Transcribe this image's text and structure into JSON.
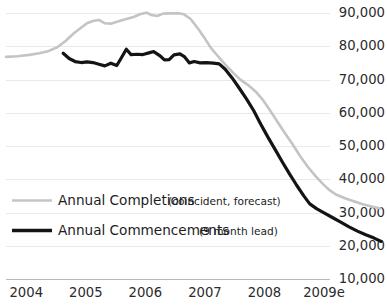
{
  "chart_data": {
    "type": "line",
    "title": "",
    "subtitle": "",
    "xlabel": "",
    "ylabel": "",
    "grid": true,
    "legend_position": "inside-lower-left",
    "x": [
      2004,
      2005,
      2006,
      2007,
      2008,
      2009
    ],
    "xtick_labels": [
      "2004",
      "2005",
      "2006",
      "2007",
      "2008",
      "2009e"
    ],
    "ytick_labels": [
      "90,000",
      "80,000",
      "70,000",
      "60,000",
      "50,000",
      "40,000",
      "30,000",
      "20,000",
      "10,000"
    ],
    "ytick_values": [
      90000,
      80000,
      70000,
      60000,
      50000,
      40000,
      30000,
      20000,
      10000
    ],
    "ylim": [
      10000,
      93000
    ],
    "xlim": [
      2003.66,
      2009.1
    ],
    "series": [
      {
        "name": "Annual Completions",
        "annotation": "(coincident, forecast)",
        "color": "#c4c4c4",
        "points": [
          [
            2003.66,
            76800
          ],
          [
            2003.85,
            77000
          ],
          [
            2004.05,
            77400
          ],
          [
            2004.22,
            77900
          ],
          [
            2004.38,
            78600
          ],
          [
            2004.52,
            79700
          ],
          [
            2004.66,
            81600
          ],
          [
            2004.8,
            83900
          ],
          [
            2004.93,
            85700
          ],
          [
            2005.02,
            86900
          ],
          [
            2005.12,
            87600
          ],
          [
            2005.22,
            87900
          ],
          [
            2005.32,
            86900
          ],
          [
            2005.42,
            86800
          ],
          [
            2005.55,
            87500
          ],
          [
            2005.68,
            88200
          ],
          [
            2005.8,
            88800
          ],
          [
            2005.92,
            89700
          ],
          [
            2006.02,
            90100
          ],
          [
            2006.1,
            89400
          ],
          [
            2006.2,
            89100
          ],
          [
            2006.3,
            89800
          ],
          [
            2006.42,
            89900
          ],
          [
            2006.55,
            89900
          ],
          [
            2006.65,
            89600
          ],
          [
            2006.76,
            88200
          ],
          [
            2006.88,
            85400
          ],
          [
            2007.0,
            82300
          ],
          [
            2007.1,
            79500
          ],
          [
            2007.22,
            77000
          ],
          [
            2007.35,
            74300
          ],
          [
            2007.48,
            71900
          ],
          [
            2007.6,
            69900
          ],
          [
            2007.72,
            68400
          ],
          [
            2007.85,
            66400
          ],
          [
            2007.98,
            63700
          ],
          [
            2008.1,
            60500
          ],
          [
            2008.22,
            57200
          ],
          [
            2008.35,
            53700
          ],
          [
            2008.48,
            50300
          ],
          [
            2008.6,
            46900
          ],
          [
            2008.72,
            43900
          ],
          [
            2008.85,
            41100
          ],
          [
            2008.98,
            38600
          ],
          [
            2009.08,
            36900
          ],
          [
            2009.2,
            35400
          ],
          [
            2009.35,
            34300
          ],
          [
            2009.5,
            33400
          ],
          [
            2009.65,
            32500
          ],
          [
            2009.8,
            31800
          ],
          [
            2009.95,
            31200
          ]
        ]
      },
      {
        "name": "Annual Commencements",
        "annotation": "(9 month lead)",
        "color": "#141414",
        "points": [
          [
            2004.62,
            77900
          ],
          [
            2004.72,
            76300
          ],
          [
            2004.82,
            75400
          ],
          [
            2004.92,
            75100
          ],
          [
            2005.02,
            75300
          ],
          [
            2005.12,
            75100
          ],
          [
            2005.22,
            74600
          ],
          [
            2005.32,
            74100
          ],
          [
            2005.42,
            74900
          ],
          [
            2005.52,
            74200
          ],
          [
            2005.6,
            76600
          ],
          [
            2005.68,
            79100
          ],
          [
            2005.76,
            77500
          ],
          [
            2005.86,
            77600
          ],
          [
            2005.96,
            77500
          ],
          [
            2006.06,
            78000
          ],
          [
            2006.14,
            78400
          ],
          [
            2006.24,
            77200
          ],
          [
            2006.32,
            75900
          ],
          [
            2006.4,
            76000
          ],
          [
            2006.48,
            77400
          ],
          [
            2006.58,
            77700
          ],
          [
            2006.66,
            76800
          ],
          [
            2006.74,
            75000
          ],
          [
            2006.82,
            75400
          ],
          [
            2006.92,
            75000
          ],
          [
            2007.02,
            75100
          ],
          [
            2007.14,
            74900
          ],
          [
            2007.24,
            74700
          ],
          [
            2007.34,
            73100
          ],
          [
            2007.46,
            70400
          ],
          [
            2007.58,
            67300
          ],
          [
            2007.7,
            64100
          ],
          [
            2007.82,
            60600
          ],
          [
            2007.94,
            56500
          ],
          [
            2008.06,
            52600
          ],
          [
            2008.18,
            48900
          ],
          [
            2008.3,
            45200
          ],
          [
            2008.42,
            41600
          ],
          [
            2008.54,
            38200
          ],
          [
            2008.66,
            35000
          ],
          [
            2008.76,
            32600
          ],
          [
            2008.88,
            31100
          ],
          [
            2009.0,
            29900
          ],
          [
            2009.14,
            28500
          ],
          [
            2009.28,
            27100
          ],
          [
            2009.42,
            25700
          ],
          [
            2009.56,
            24400
          ],
          [
            2009.7,
            23300
          ],
          [
            2009.84,
            22300
          ],
          [
            2009.96,
            21300
          ]
        ]
      }
    ]
  },
  "legend": {
    "items": [
      {
        "label": "Annual Completions",
        "note": "(coincident, forecast)",
        "color": "#c4c4c4"
      },
      {
        "label": "Annual Commencements",
        "note": "(9 month lead)",
        "color": "#141414"
      }
    ]
  },
  "colors": {
    "completions": "#c4c4c4",
    "commencements": "#141414",
    "grid": "#e9e9e9",
    "axis": "#b9b9b9",
    "text": "#2b2b2b",
    "background": "#ffffff"
  }
}
